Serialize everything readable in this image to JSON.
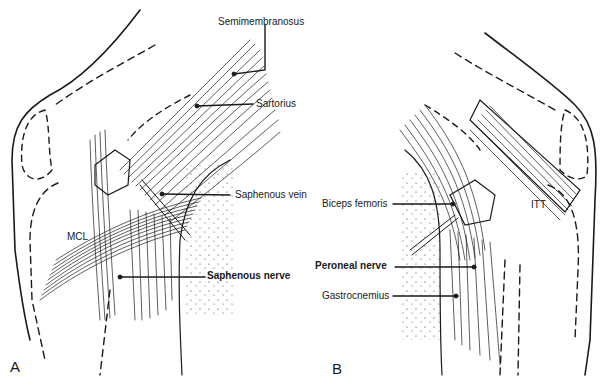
{
  "figure": {
    "panels": [
      {
        "id": "A",
        "label": "A",
        "labels": [
          {
            "text": "Semimembranosus",
            "bold": false
          },
          {
            "text": "Sartorius",
            "bold": false
          },
          {
            "text": "Saphenous vein",
            "bold": false
          },
          {
            "text": "MCL",
            "bold": false
          },
          {
            "text": "Saphenous nerve",
            "bold": true
          }
        ]
      },
      {
        "id": "B",
        "label": "B",
        "labels": [
          {
            "text": "Biceps femoris",
            "bold": false
          },
          {
            "text": "ITT",
            "bold": false
          },
          {
            "text": "Peroneal nerve",
            "bold": true
          },
          {
            "text": "Gastrocnemius",
            "bold": false
          }
        ]
      }
    ],
    "colors": {
      "line": "#1a1a1a",
      "background": "#ffffff"
    }
  }
}
